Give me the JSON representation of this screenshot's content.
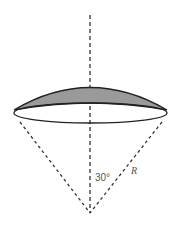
{
  "diagram": {
    "type": "geometry",
    "labels": {
      "angle": "30°",
      "radius": "R"
    },
    "colors": {
      "cap_fill": "#9a9a9a",
      "stroke": "#222222",
      "dashed": "#333333",
      "label": "#555555"
    }
  }
}
